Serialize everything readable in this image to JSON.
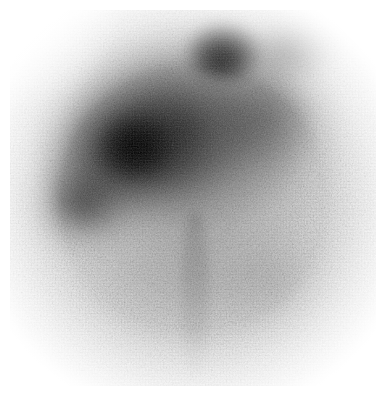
{
  "image": {
    "kind": "nuclear-medicine-scintigram",
    "modality_label": "Gamma camera scintigram",
    "orientation_label": "Anterior view",
    "caption": "",
    "width_px": 386,
    "height_px": 396,
    "colormap": "grayscale-inverted",
    "background_color": "#ffffff",
    "film_base_color": "#f3f3f3",
    "max_density_color": "#000000"
  },
  "field_of_view": {
    "shape": "circular",
    "center_x_pct": 50,
    "center_y_pct": 48,
    "radius_pct": 52,
    "margin_px": 10
  },
  "regions": [
    {
      "name": "diffuse-upper-uptake",
      "label": "Diffuse high uptake, upper hemisphere",
      "intensity": "high",
      "center_x_pct": 48,
      "center_y_pct": 28
    },
    {
      "name": "main-uptake-band",
      "label": "Dense uptake band, upper-left to mid-centre",
      "intensity": "very-high",
      "center_x_pct": 36,
      "center_y_pct": 36
    },
    {
      "name": "focal-hot-spot",
      "label": "Intense focal hot spot, superior centre-right",
      "intensity": "maximum",
      "center_x_pct": 58,
      "center_y_pct": 11
    },
    {
      "name": "focal-node-left",
      "label": "Focal dense node, left of midline",
      "intensity": "very-high",
      "center_x_pct": 34,
      "center_y_pct": 36
    },
    {
      "name": "lower-left-tail",
      "label": "Tapering activity, lower-left margin",
      "intensity": "moderate",
      "center_x_pct": 19,
      "center_y_pct": 53
    },
    {
      "name": "right-shoulder",
      "label": "Moderate uptake, right shoulder of field",
      "intensity": "moderate",
      "center_x_pct": 70,
      "center_y_pct": 28
    },
    {
      "name": "lower-diffuse-background",
      "label": "Low background activity, inferior field",
      "intensity": "low",
      "center_x_pct": 51,
      "center_y_pct": 74
    },
    {
      "name": "midline-structure",
      "label": "Faint vertical midline structure, inferior field",
      "intensity": "low",
      "center_x_pct": 50,
      "center_y_pct": 76
    }
  ],
  "annotations": {
    "markers": [],
    "text_overlays": []
  }
}
